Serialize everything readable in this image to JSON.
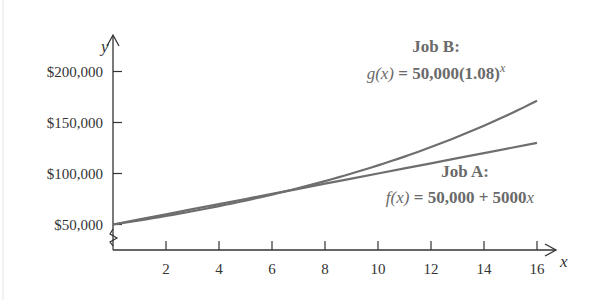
{
  "chart_data": {
    "type": "line",
    "title": "",
    "xlabel": "x",
    "ylabel": "y",
    "xlim": [
      0,
      16.7
    ],
    "ylim": [
      50000,
      230000
    ],
    "y_axis_break": true,
    "grid": false,
    "x_ticks": [
      2,
      4,
      6,
      8,
      10,
      12,
      14,
      16
    ],
    "x_tick_labels": [
      "2",
      "4",
      "6",
      "8",
      "10",
      "12",
      "14",
      "16"
    ],
    "y_ticks": [
      50000,
      100000,
      150000,
      200000
    ],
    "y_tick_labels": [
      "$50,000",
      "$100,000",
      "$150,000",
      "$200,000"
    ],
    "x": [
      0,
      1,
      2,
      3,
      4,
      5,
      6,
      7,
      8,
      9,
      10,
      11,
      12,
      13,
      14,
      15,
      16
    ],
    "series": [
      {
        "name": "Job A",
        "formula": "f(x) = 50,000 + 5000x",
        "values": [
          50000,
          55000,
          60000,
          65000,
          70000,
          75000,
          80000,
          85000,
          90000,
          95000,
          100000,
          105000,
          110000,
          115000,
          120000,
          125000,
          130000
        ]
      },
      {
        "name": "Job B",
        "formula": "g(x) = 50,000(1.08)^x",
        "values": [
          50000,
          54000,
          58320,
          62986,
          68024,
          73466,
          79344,
          85691,
          92547,
          99950,
          107946,
          116582,
          125909,
          135981,
          146860,
          158608,
          171297
        ]
      }
    ],
    "annotations": [
      {
        "series": "Job B",
        "title": "Job B:",
        "equation_lhs": "g",
        "equation_arg": "(x)",
        "equation_rhs": " = 50,000(1.08)",
        "equation_exp": "x"
      },
      {
        "series": "Job A",
        "title": "Job A:",
        "equation_lhs": "f",
        "equation_arg": "(x)",
        "equation_rhs": " = 50,000 + 5000",
        "equation_var": "x"
      }
    ],
    "legend": "none (inline annotations)"
  },
  "colors": {
    "axis": "#333333",
    "curve": "#6e6e6e",
    "annotation": "#6a6a6a"
  }
}
